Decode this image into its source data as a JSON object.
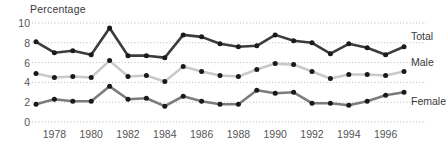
{
  "chart_data": {
    "type": "line",
    "title": "",
    "ylabel": "Percentage",
    "xlabel": "",
    "ylim": [
      0,
      10
    ],
    "yticks": [
      0,
      2,
      4,
      6,
      8,
      10
    ],
    "xlim": [
      1977,
      1997
    ],
    "xticks": [
      1978,
      1980,
      1982,
      1984,
      1986,
      1988,
      1990,
      1992,
      1994,
      1996
    ],
    "x": [
      1977,
      1978,
      1979,
      1980,
      1981,
      1982,
      1983,
      1984,
      1985,
      1986,
      1987,
      1988,
      1989,
      1990,
      1991,
      1992,
      1993,
      1994,
      1995,
      1996,
      1997
    ],
    "grid": "horizontal-dotted",
    "legend_position": "right-inline",
    "series": [
      {
        "name": "Total",
        "color": "#3c3c3c",
        "values": [
          8.1,
          7.0,
          7.2,
          6.8,
          9.5,
          6.7,
          6.7,
          6.5,
          8.8,
          8.6,
          7.9,
          7.6,
          7.7,
          8.8,
          8.2,
          8.0,
          6.9,
          7.9,
          7.5,
          6.8,
          7.6
        ]
      },
      {
        "name": "Male",
        "color": "#c9c9c9",
        "values": [
          4.9,
          4.5,
          4.6,
          4.5,
          6.2,
          4.6,
          4.7,
          4.1,
          5.6,
          5.1,
          4.7,
          4.6,
          5.3,
          5.9,
          5.8,
          5.1,
          4.4,
          4.8,
          4.8,
          4.7,
          5.1
        ]
      },
      {
        "name": "Female",
        "color": "#7c7c7c",
        "values": [
          1.8,
          2.3,
          2.1,
          2.1,
          3.6,
          2.3,
          2.4,
          1.6,
          2.6,
          2.1,
          1.8,
          1.8,
          3.2,
          2.9,
          3.0,
          1.9,
          1.9,
          1.7,
          2.1,
          2.7,
          3.0
        ]
      }
    ],
    "marker_color": "#1a1a1a",
    "axis_text_color": "#555555"
  }
}
